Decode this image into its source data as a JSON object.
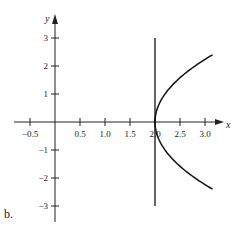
{
  "panel_label": "b.",
  "chart_data": {
    "type": "line",
    "title": "",
    "xlabel": "x",
    "ylabel": "y",
    "xlim": [
      -0.7,
      3.3
    ],
    "ylim": [
      -3.3,
      3.3
    ],
    "grid": false,
    "x_ticks": [
      -0.5,
      0.5,
      1.0,
      1.5,
      2.0,
      2.5,
      3.0
    ],
    "x_tick_labels": [
      "−0.5",
      "0.5",
      "1.0",
      "1.5",
      "2.0",
      "2.5",
      "3.0"
    ],
    "y_ticks": [
      -3,
      -2,
      -1,
      1,
      2,
      3
    ],
    "y_tick_labels": [
      "−3",
      "−2",
      "−1",
      "1",
      "2",
      "3"
    ],
    "series": [
      {
        "name": "vertical line x = 2",
        "x": [
          2,
          2
        ],
        "y": [
          -3,
          3
        ]
      },
      {
        "name": "parabola opening right, vertex (2, 0)",
        "x": [
          3.15,
          2.8,
          2.45,
          2.2,
          2.05,
          2.0,
          2.05,
          2.2,
          2.45,
          2.8,
          3.15
        ],
        "y": [
          -2.4,
          -2.0,
          -1.5,
          -1.0,
          -0.5,
          0,
          0.5,
          1.0,
          1.5,
          2.0,
          2.4
        ]
      }
    ],
    "legend": null
  }
}
